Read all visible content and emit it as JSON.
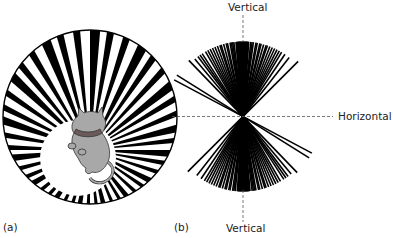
{
  "panel_a": {
    "label": "(a)",
    "description": "kitten inside a cylinder of black and white stripes radiating from center",
    "colors": {
      "stripe": "#000000",
      "background": "#ffffff",
      "cat": "#a9a9a9"
    }
  },
  "panel_b": {
    "label": "(b)",
    "axis_labels": {
      "top": "Vertical",
      "bottom": "Vertical",
      "right": "Horizontal"
    },
    "description": "orientation distribution fan concentrated around vertical"
  }
}
